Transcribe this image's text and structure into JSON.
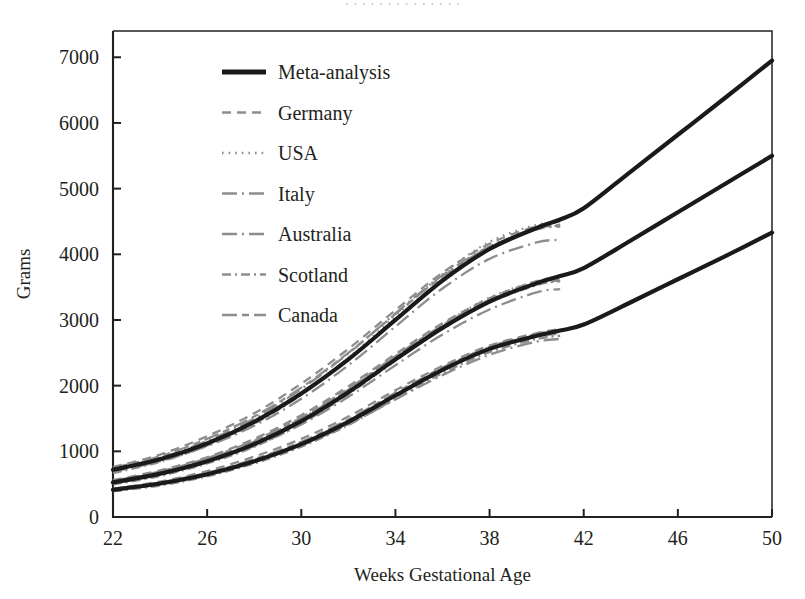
{
  "top_clipped_text": "· · ·   · · ·  ·  · ·   ·   · ·   ·  ·",
  "chart_data": {
    "type": "line",
    "title": "",
    "xlabel": "Weeks Gestational Age",
    "ylabel": "Grams",
    "xlim": [
      22,
      50
    ],
    "ylim": [
      0,
      7400
    ],
    "xticks": [
      22,
      26,
      30,
      34,
      38,
      42,
      46,
      50
    ],
    "yticks": [
      0,
      1000,
      2000,
      3000,
      4000,
      5000,
      6000,
      7000
    ],
    "grid": false,
    "legend_position": "upper-left-inside",
    "legend": [
      {
        "label": "Meta-analysis",
        "style": "solid-thick",
        "color": "#1a1a1a"
      },
      {
        "label": "Germany",
        "style": "dashed",
        "color": "#8d8d8d"
      },
      {
        "label": "USA",
        "style": "dotted",
        "color": "#8d8d8d"
      },
      {
        "label": "Italy",
        "style": "long-dash-dot",
        "color": "#8d8d8d"
      },
      {
        "label": "Australia",
        "style": "long-dash-dot",
        "color": "#8d8d8d"
      },
      {
        "label": "Scotland",
        "style": "dash-dot-dash",
        "color": "#8d8d8d"
      },
      {
        "label": "Canada",
        "style": "long-dash-dash",
        "color": "#8d8d8d"
      }
    ],
    "note": "Three percentile bands (upper ~90th, middle ~50th, lower ~10th). Meta-analysis drawn 22-50 wk; country curves drawn 22-41 wk.",
    "x": [
      22,
      24,
      26,
      28,
      30,
      32,
      34,
      36,
      38,
      40,
      41,
      42,
      44,
      46,
      48,
      50
    ],
    "series": [
      {
        "name": "Meta-analysis upper",
        "band": "upper",
        "values": [
          720,
          880,
          1120,
          1450,
          1880,
          2400,
          3000,
          3600,
          4080,
          4400,
          4530,
          4700,
          5260,
          5820,
          6380,
          6950
        ]
      },
      {
        "name": "Meta-analysis middle",
        "band": "middle",
        "values": [
          525,
          660,
          850,
          1110,
          1460,
          1900,
          2400,
          2880,
          3280,
          3560,
          3670,
          3790,
          4210,
          4640,
          5070,
          5500
        ]
      },
      {
        "name": "Meta-analysis lower",
        "band": "lower",
        "values": [
          415,
          510,
          650,
          850,
          1110,
          1450,
          1850,
          2240,
          2560,
          2760,
          2840,
          2930,
          3270,
          3620,
          3970,
          4330
        ]
      },
      {
        "name": "Germany upper",
        "band": "upper",
        "values": [
          760,
          950,
          1230,
          1580,
          2030,
          2560,
          3150,
          3720,
          4160,
          4430,
          4500,
          null,
          null,
          null,
          null,
          null
        ]
      },
      {
        "name": "Germany middle",
        "band": "middle",
        "values": [
          560,
          710,
          910,
          1190,
          1550,
          1990,
          2480,
          2950,
          3330,
          3590,
          3660,
          null,
          null,
          null,
          null,
          null
        ]
      },
      {
        "name": "Germany lower",
        "band": "lower",
        "values": [
          430,
          540,
          700,
          920,
          1190,
          1530,
          1930,
          2300,
          2610,
          2800,
          2860,
          null,
          null,
          null,
          null,
          null
        ]
      },
      {
        "name": "USA upper",
        "band": "upper",
        "values": [
          700,
          870,
          1110,
          1440,
          1880,
          2420,
          3060,
          3700,
          4190,
          4450,
          4480,
          null,
          null,
          null,
          null,
          null
        ]
      },
      {
        "name": "USA middle",
        "band": "middle",
        "values": [
          510,
          640,
          830,
          1090,
          1450,
          1910,
          2430,
          2930,
          3340,
          3590,
          3620,
          null,
          null,
          null,
          null,
          null
        ]
      },
      {
        "name": "USA lower",
        "band": "lower",
        "values": [
          400,
          490,
          630,
          830,
          1090,
          1440,
          1860,
          2260,
          2590,
          2780,
          2810,
          null,
          null,
          null,
          null,
          null
        ]
      },
      {
        "name": "Italy upper",
        "band": "upper",
        "values": [
          690,
          850,
          1080,
          1390,
          1800,
          2310,
          2900,
          3480,
          3930,
          4180,
          4220,
          null,
          null,
          null,
          null,
          null
        ]
      },
      {
        "name": "Italy middle",
        "band": "middle",
        "values": [
          520,
          650,
          830,
          1080,
          1410,
          1830,
          2310,
          2780,
          3160,
          3420,
          3470,
          null,
          null,
          null,
          null,
          null
        ]
      },
      {
        "name": "Italy lower",
        "band": "lower",
        "values": [
          420,
          510,
          650,
          840,
          1090,
          1410,
          1790,
          2160,
          2470,
          2670,
          2710,
          null,
          null,
          null,
          null,
          null
        ]
      },
      {
        "name": "Australia upper",
        "band": "upper",
        "values": [
          730,
          900,
          1160,
          1500,
          1950,
          2490,
          3100,
          3680,
          4120,
          4380,
          4420,
          null,
          null,
          null,
          null,
          null
        ]
      },
      {
        "name": "Australia middle",
        "band": "middle",
        "values": [
          540,
          680,
          880,
          1150,
          1500,
          1940,
          2440,
          2910,
          3300,
          3550,
          3600,
          null,
          null,
          null,
          null,
          null
        ]
      },
      {
        "name": "Australia lower",
        "band": "lower",
        "values": [
          410,
          505,
          645,
          845,
          1105,
          1440,
          1840,
          2230,
          2550,
          2750,
          2790,
          null,
          null,
          null,
          null,
          null
        ]
      },
      {
        "name": "Scotland upper",
        "band": "upper",
        "values": [
          670,
          840,
          1090,
          1420,
          1860,
          2400,
          3010,
          3620,
          4090,
          4380,
          4440,
          null,
          null,
          null,
          null,
          null
        ]
      },
      {
        "name": "Scotland middle",
        "band": "middle",
        "values": [
          495,
          625,
          815,
          1070,
          1420,
          1870,
          2380,
          2870,
          3270,
          3530,
          3590,
          null,
          null,
          null,
          null,
          null
        ]
      },
      {
        "name": "Scotland lower",
        "band": "lower",
        "values": [
          390,
          480,
          620,
          815,
          1070,
          1400,
          1800,
          2190,
          2510,
          2710,
          2760,
          null,
          null,
          null,
          null,
          null
        ]
      },
      {
        "name": "Canada upper",
        "band": "upper",
        "values": [
          745,
          925,
          1190,
          1530,
          1970,
          2500,
          3090,
          3660,
          4110,
          4390,
          4450,
          null,
          null,
          null,
          null,
          null
        ]
      },
      {
        "name": "Canada middle",
        "band": "middle",
        "values": [
          550,
          695,
          895,
          1165,
          1515,
          1955,
          2450,
          2920,
          3310,
          3570,
          3630,
          null,
          null,
          null,
          null,
          null
        ]
      },
      {
        "name": "Canada lower",
        "band": "lower",
        "values": [
          425,
          525,
          675,
          880,
          1145,
          1485,
          1890,
          2275,
          2590,
          2790,
          2840,
          null,
          null,
          null,
          null,
          null
        ]
      }
    ]
  }
}
